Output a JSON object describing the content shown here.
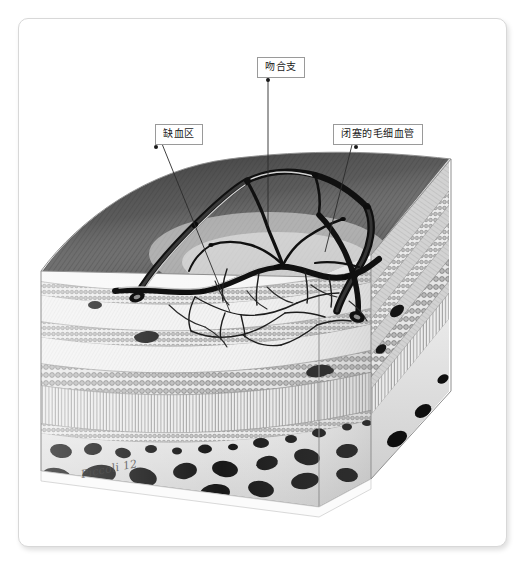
{
  "figure": {
    "signature": "Piccoli 12",
    "colors": {
      "card_background": "#ffffff",
      "card_border": "#d8d8d8",
      "label_border": "#9a9a9a",
      "label_text": "#1a1a1a",
      "leader_line": "#2b2b2b",
      "vessel_dark": "#121212",
      "top_surface_dark": "#3c3c3c",
      "top_surface_light": "#d8d8d8",
      "bone_marrow": "#0d0d0d",
      "tissue_pale": "#efefef"
    }
  },
  "labels": [
    {
      "id": "anastomotic-branch",
      "text": "吻合支",
      "box": {
        "x": 238,
        "y": 38
      },
      "anchor": {
        "x": 267,
        "y": 61
      },
      "target": {
        "x": 267,
        "y": 228
      }
    },
    {
      "id": "ischemic-zone",
      "text": "缺血区",
      "box": {
        "x": 136,
        "y": 105
      },
      "anchor": {
        "x": 155,
        "y": 128
      },
      "target": {
        "x": 229,
        "y": 311
      }
    },
    {
      "id": "occluded-capillary",
      "text": "闭塞的毛细血管",
      "box": {
        "x": 314,
        "y": 105
      },
      "anchor": {
        "x": 355,
        "y": 128
      },
      "target": {
        "x": 324,
        "y": 251
      }
    }
  ]
}
